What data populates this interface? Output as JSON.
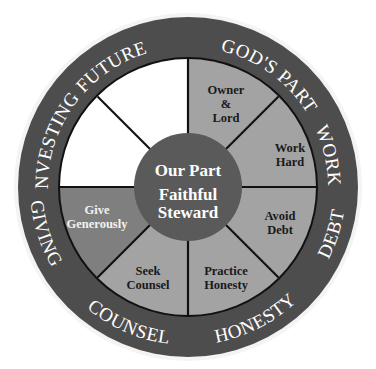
{
  "diagram": {
    "title": "Our Part Faithful Steward",
    "colors": {
      "ring": "#4d4d4d",
      "segment_light": "#a3a3a3",
      "segment_medium": "#7f7f7f",
      "segment_blank": "#ffffff",
      "hub": "#5a5a5a",
      "divider": "#111111",
      "ring_text": "#ffffff",
      "segment_text_dark": "#1a1a1a"
    },
    "hub": {
      "line1": "Our Part",
      "line2": "Faithful",
      "line3": "Steward"
    },
    "ring_labels": {
      "gods_part": "GOD'S PART",
      "work": "WORK",
      "debt": "DEBT",
      "honesty": "HONESTY",
      "counsel": "COUNSEL",
      "giving": "GIVING",
      "investing": "INVESTING",
      "future": "FUTURE"
    },
    "segments": [
      {
        "name": "owner-lord",
        "lines": [
          "Owner",
          "&",
          "Lord"
        ]
      },
      {
        "name": "work-hard",
        "lines": [
          "Work",
          "Hard"
        ]
      },
      {
        "name": "avoid-debt",
        "lines": [
          "Avoid",
          "Debt"
        ]
      },
      {
        "name": "practice-honesty",
        "lines": [
          "Practice",
          "Honesty"
        ]
      },
      {
        "name": "seek-counsel",
        "lines": [
          "Seek",
          "Counsel"
        ]
      },
      {
        "name": "give-generously",
        "lines": [
          "Give",
          "Generously"
        ]
      },
      {
        "name": "investing-blank",
        "lines": []
      },
      {
        "name": "future-blank",
        "lines": []
      }
    ]
  }
}
